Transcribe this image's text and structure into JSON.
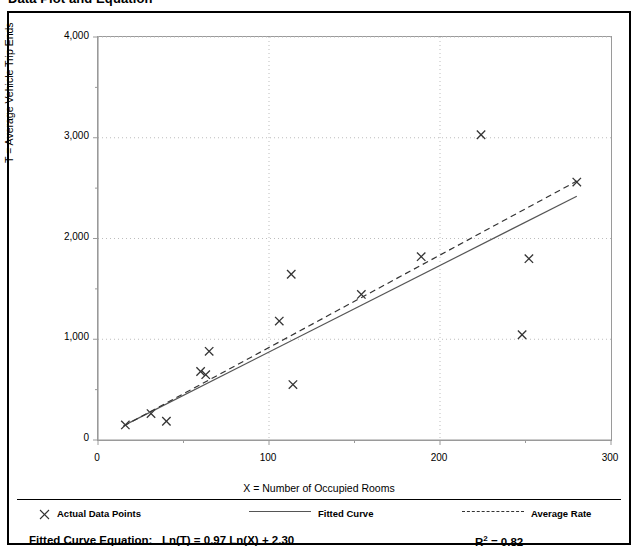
{
  "title": "Data Plot and Equation",
  "axes": {
    "x_title": "X = Number of Occupied Rooms",
    "y_title": "T = Average Vehicle Trip Ends",
    "x_ticks": [
      "0",
      "100",
      "200",
      "300"
    ],
    "y_ticks": [
      "0",
      "1,000",
      "2,000",
      "3,000",
      "4,000"
    ]
  },
  "legend": {
    "points_label": "Actual Data Points",
    "fitted_label": "Fitted Curve",
    "average_label": "Average Rate"
  },
  "equation": {
    "label": "Fitted Curve Equation:",
    "expression": "Ln(T) = 0.97 Ln(X) + 2.30",
    "r2_prefix": "R",
    "r2_exp": "2",
    "r2_value": " = 0.82"
  },
  "colors": {
    "frame": "#000000",
    "axis": "#9a9a9a",
    "grid": "#bdbdbd",
    "marker": "#333333",
    "fitted": "#555555",
    "average": "#333333"
  },
  "chart_data": {
    "type": "scatter",
    "title": "Data Plot and Equation",
    "xlabel": "X = Number of Occupied Rooms",
    "ylabel": "T = Average Vehicle Trip Ends",
    "xlim": [
      0,
      300
    ],
    "ylim": [
      0,
      4000
    ],
    "x_ticks": [
      0,
      100,
      200,
      300
    ],
    "y_ticks": [
      0,
      1000,
      2000,
      3000,
      4000
    ],
    "x_minor_tick_interval": 50,
    "y_minor_tick_interval": 500,
    "grid": "dotted gridlines at major x and y ticks",
    "legend_position": "below plot, horizontal",
    "series": [
      {
        "name": "Actual Data Points",
        "type": "scatter",
        "marker": "x",
        "points": [
          [
            16,
            150
          ],
          [
            31,
            262
          ],
          [
            40,
            186
          ],
          [
            60,
            680
          ],
          [
            63,
            648
          ],
          [
            65,
            880
          ],
          [
            106,
            1180
          ],
          [
            113,
            1645
          ],
          [
            114,
            550
          ],
          [
            154,
            1445
          ],
          [
            189,
            1820
          ],
          [
            224,
            3030
          ],
          [
            248,
            1045
          ],
          [
            252,
            1800
          ],
          [
            280,
            2560
          ]
        ]
      },
      {
        "name": "Fitted Curve",
        "type": "line",
        "style": "solid",
        "equation": "Ln(T) = 0.97 Ln(X) + 2.30",
        "r_squared": 0.82,
        "endpoints": [
          [
            15,
            143
          ],
          [
            280,
            2420
          ]
        ]
      },
      {
        "name": "Average Rate",
        "type": "line",
        "style": "dashed",
        "endpoints": [
          [
            15,
            138
          ],
          [
            280,
            2570
          ]
        ]
      }
    ],
    "annotations": [
      "Fitted Curve Equation:  Ln(T) = 0.97 Ln(X) + 2.30",
      "R2 = 0.82"
    ]
  }
}
